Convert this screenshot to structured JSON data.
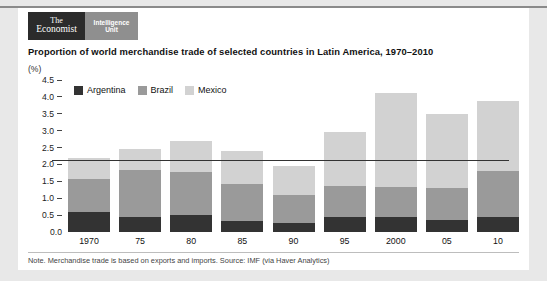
{
  "brand": {
    "economist_line1": "The",
    "economist_line2": "Economist",
    "eiu_line1": "Intelligence",
    "eiu_line2": "Unit"
  },
  "footnote": "Note. Merchandise trade is based on exports and imports.  Source: IMF (via Haver Analytics)",
  "colors": {
    "argentina": "#333333",
    "brazil": "#9a9a9a",
    "mexico": "#d2d2d2",
    "card_bg": "#ffffff",
    "page_bg": "#e8e8e8",
    "axis": "#333333"
  },
  "chart_data": {
    "type": "bar",
    "stacked": true,
    "title": "Proportion of world merchandise trade of selected countries in Latin America, 1970–2010",
    "unit_label": "(%)",
    "xlabel": "",
    "ylabel": "",
    "ylim": [
      0.0,
      4.5
    ],
    "yticks": [
      "0.0",
      "0.5",
      "1.0",
      "1.5",
      "2.0",
      "2.5",
      "3.0",
      "3.5",
      "4.0",
      "4.5"
    ],
    "ytick_values": [
      0.0,
      0.5,
      1.0,
      1.5,
      2.0,
      2.5,
      3.0,
      3.5,
      4.0,
      4.5
    ],
    "grid": false,
    "legend_position": "top-left",
    "categories": [
      "1970",
      "75",
      "80",
      "85",
      "90",
      "95",
      "2000",
      "05",
      "10"
    ],
    "series": [
      {
        "name": "Argentina",
        "color": "#333333",
        "values": [
          0.6,
          0.44,
          0.51,
          0.34,
          0.27,
          0.43,
          0.44,
          0.37,
          0.44
        ]
      },
      {
        "name": "Brazil",
        "color": "#9a9a9a",
        "values": [
          0.97,
          1.39,
          1.27,
          1.07,
          0.82,
          0.94,
          0.89,
          0.93,
          1.36
        ]
      },
      {
        "name": "Mexico",
        "color": "#d2d2d2",
        "values": [
          0.62,
          0.62,
          0.92,
          0.99,
          0.86,
          1.58,
          2.8,
          2.19,
          2.09
        ]
      }
    ],
    "totals": [
      2.19,
      2.45,
      2.7,
      2.4,
      1.95,
      2.95,
      4.13,
      3.49,
      3.89
    ]
  }
}
